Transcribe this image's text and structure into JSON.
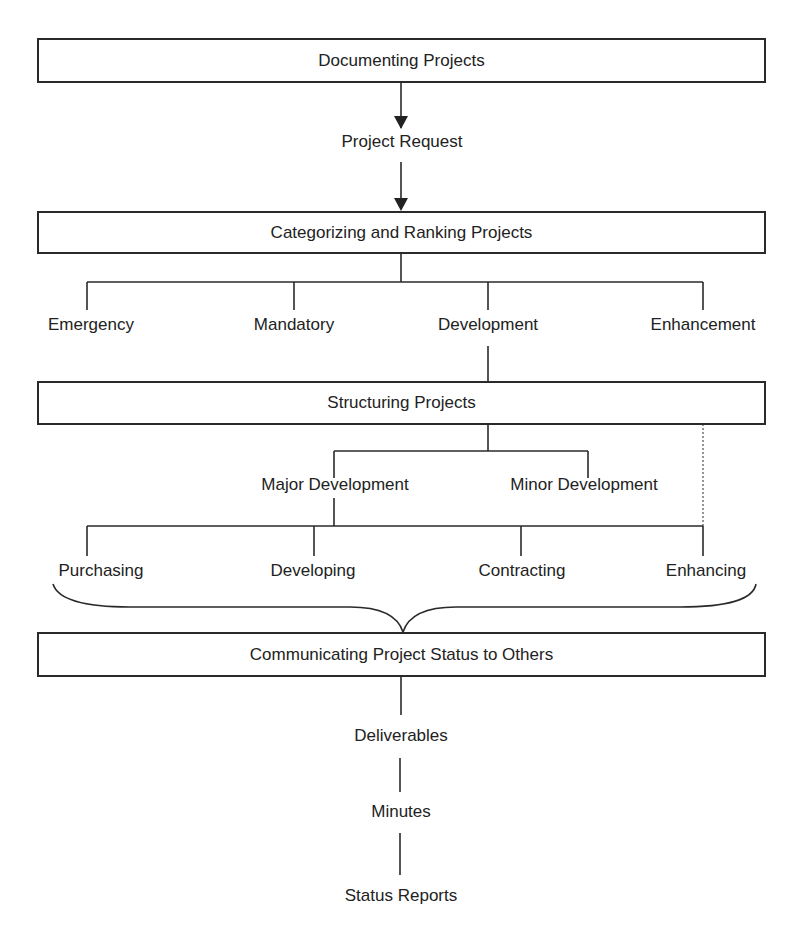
{
  "diagram": {
    "boxes": {
      "documenting": "Documenting Projects",
      "categorizing": "Categorizing and Ranking Projects",
      "structuring": "Structuring Projects",
      "communicating": "Communicating Project Status to Others"
    },
    "project_request": "Project Request",
    "categories": [
      "Emergency",
      "Mandatory",
      "Development",
      "Enhancement"
    ],
    "development_types": [
      "Major Development",
      "Minor Development"
    ],
    "methods": [
      "Purchasing",
      "Developing",
      "Contracting",
      "Enhancing"
    ],
    "outputs": [
      "Deliverables",
      "Minutes",
      "Status Reports"
    ]
  }
}
